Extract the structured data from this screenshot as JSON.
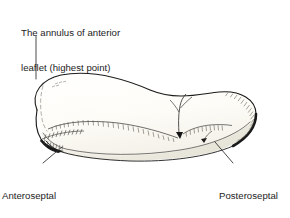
{
  "figure": {
    "background_color": "#ffffff",
    "ink_color": "#1c1c1c",
    "fill_color": "#fbfaf5"
  },
  "labels": {
    "annulus": {
      "name": "annulus-of-anterior-leaflet",
      "line1": "The annulus of anterior",
      "line2": "leaflet (highest point)"
    },
    "anteroseptal": {
      "name": "anteroseptal-commissure",
      "line1": "Anteroseptal",
      "line2": "commissure",
      "line3": "(lowest point)"
    },
    "posteroseptal": {
      "name": "posteroseptal-commissure",
      "line1": "Posteroseptal",
      "line2": "commissure"
    }
  },
  "leaders": [
    {
      "name": "leader-annulus",
      "from_label": "annulus",
      "x1": 36,
      "y1": 36,
      "x2": 36,
      "y2": 79
    },
    {
      "name": "leader-anteroseptal",
      "from_label": "anteroseptal",
      "x1": 43,
      "y1": 163,
      "x2": 62,
      "y2": 148
    },
    {
      "name": "leader-posteroseptal",
      "from_label": "posteroseptal",
      "x1": 233,
      "y1": 163,
      "x2": 216,
      "y2": 143
    }
  ]
}
